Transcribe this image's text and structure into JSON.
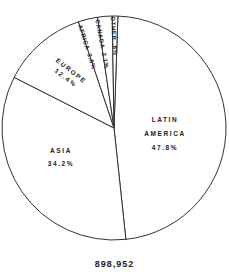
{
  "chart_data": {
    "type": "pie",
    "title": "",
    "total_label": "898,952",
    "start_angle_deg": 2,
    "direction": "clockwise",
    "slices": [
      {
        "label": "LATIN AMERICA",
        "label_lines": [
          "LATIN",
          "AMERICA"
        ],
        "value": 47.8,
        "value_label": "47.8%"
      },
      {
        "label": "ASIA",
        "label_lines": [
          "ASIA"
        ],
        "value": 34.2,
        "value_label": "34.2%"
      },
      {
        "label": "EUROPE",
        "label_lines": [
          "EUROPE"
        ],
        "value": 12.4,
        "value_label": "12.4%"
      },
      {
        "label": "AFRICA",
        "label_lines": [
          "AFRICA"
        ],
        "value": 2.8,
        "value_label": "2.8%"
      },
      {
        "label": "CANADA",
        "label_lines": [
          "CANADA"
        ],
        "value": 2.1,
        "value_label": "2.1%"
      },
      {
        "label": "OTHER",
        "label_lines": [
          "OTHER"
        ],
        "value": 0.8,
        "value_label": ".8%"
      }
    ],
    "colors": {
      "fill": "#ffffff",
      "stroke": "#333333",
      "text": "#222222"
    }
  }
}
